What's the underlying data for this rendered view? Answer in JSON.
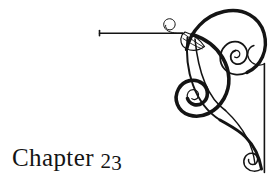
{
  "page": {
    "background_color": "#ffffff",
    "ink_color": "#141414",
    "width": 278,
    "height": 189
  },
  "heading": {
    "full_text": "Chapter 23",
    "word": "Chapter",
    "space": " ",
    "number": "23",
    "number_first_digit": "2",
    "number_second_digit": "3"
  },
  "ornament": {
    "name": "corner-flourish-ornament",
    "description": "Decorative scrollwork corner flourish with spiral terminals",
    "position": "top-right",
    "stroke_color": "#141414",
    "rules": {
      "horizontal_rule_label": "horizontal-rule",
      "vertical_rule_label": "vertical-rule"
    }
  }
}
